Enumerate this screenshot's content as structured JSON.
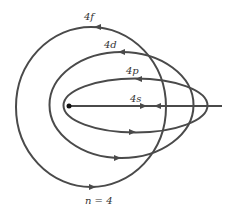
{
  "diagram": {
    "stroke_color": "#4a4a4a",
    "nucleus_color": "#111111",
    "orbits": [
      {
        "label": "4f",
        "cx": 91,
        "cy": 107,
        "rx": 75,
        "ry": 80
      },
      {
        "label": "4d",
        "cx": 121.5,
        "cy": 105,
        "rx": 72,
        "ry": 53
      },
      {
        "label": "4p",
        "cx": 135.5,
        "cy": 105.5,
        "rx": 72,
        "ry": 27
      },
      {
        "label": "4s",
        "type": "line",
        "x1": 69,
        "x2": 222,
        "y": 106
      }
    ],
    "labels": {
      "f": "4f",
      "d": "4d",
      "p": "4p",
      "s": "4s",
      "n": "n = 4"
    }
  }
}
